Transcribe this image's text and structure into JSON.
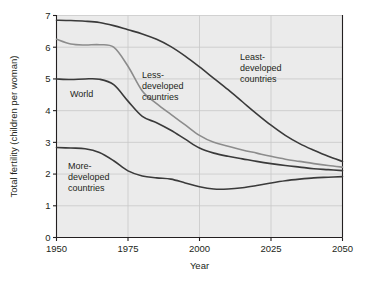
{
  "chart_data": {
    "type": "line",
    "title": "",
    "subtitle": "",
    "xlabel": "Year",
    "ylabel": "Total fertility (children per woman)",
    "xlim": [
      1950,
      2050
    ],
    "ylim": [
      0,
      7
    ],
    "xticks": [
      1950,
      1975,
      2000,
      2025,
      2050
    ],
    "xticklabels": [
      "1950",
      "1975",
      "2000",
      "2025",
      "2050"
    ],
    "yticks": [
      0,
      1,
      2,
      3,
      4,
      5,
      6,
      7
    ],
    "yticklabels": [
      "0",
      "1",
      "2",
      "3",
      "4",
      "5",
      "6",
      "7"
    ],
    "grid": true,
    "grid_color": "#c8c8c8",
    "plot_background": "#ebebeb",
    "legend": "inline-annotations",
    "x": [
      1950,
      1955,
      1960,
      1965,
      1970,
      1975,
      1980,
      1985,
      1990,
      1995,
      2000,
      2005,
      2010,
      2015,
      2020,
      2025,
      2030,
      2035,
      2040,
      2045,
      2050
    ],
    "series": [
      {
        "name": "Least-developed countries",
        "label": "Least-\ndeveloped\ncountries",
        "color": "#3a3a3a",
        "linewidth": 1.6,
        "values": [
          6.85,
          6.84,
          6.82,
          6.78,
          6.68,
          6.55,
          6.42,
          6.25,
          6.02,
          5.72,
          5.38,
          5.02,
          4.66,
          4.28,
          3.9,
          3.54,
          3.22,
          2.96,
          2.75,
          2.56,
          2.4
        ]
      },
      {
        "name": "Less-developed countries",
        "label": "Less-\ndeveloped\ncountries",
        "color": "#8c8c8c",
        "linewidth": 1.6,
        "values": [
          6.25,
          6.1,
          6.07,
          6.08,
          6.0,
          5.4,
          4.62,
          4.22,
          3.88,
          3.55,
          3.22,
          3.0,
          2.88,
          2.76,
          2.66,
          2.56,
          2.47,
          2.4,
          2.33,
          2.27,
          2.22
        ]
      },
      {
        "name": "World",
        "label": "World",
        "color": "#3a3a3a",
        "linewidth": 1.6,
        "values": [
          5.0,
          4.98,
          5.0,
          4.99,
          4.82,
          4.3,
          3.82,
          3.62,
          3.38,
          3.1,
          2.82,
          2.66,
          2.56,
          2.48,
          2.4,
          2.33,
          2.27,
          2.22,
          2.17,
          2.14,
          2.11
        ]
      },
      {
        "name": "More-developed countries",
        "label": "More-\ndeveloped\ncountries",
        "color": "#3a3a3a",
        "linewidth": 1.6,
        "values": [
          2.84,
          2.82,
          2.8,
          2.68,
          2.42,
          2.1,
          1.94,
          1.88,
          1.84,
          1.72,
          1.6,
          1.53,
          1.53,
          1.57,
          1.64,
          1.72,
          1.79,
          1.84,
          1.88,
          1.9,
          1.92
        ]
      }
    ],
    "annotations": [
      {
        "name": "world",
        "text_lines": [
          "World"
        ],
        "x_px": 70,
        "y_px": 97
      },
      {
        "name": "less-developed",
        "text_lines": [
          "Less-",
          "developed",
          "countries"
        ],
        "x_px": 142,
        "y_px": 78
      },
      {
        "name": "least-developed",
        "text_lines": [
          "Least-",
          "developed",
          "countries"
        ],
        "x_px": 240,
        "y_px": 60
      },
      {
        "name": "more-developed",
        "text_lines": [
          "More-",
          "developed",
          "countries"
        ],
        "x_px": 68,
        "y_px": 169
      }
    ]
  }
}
